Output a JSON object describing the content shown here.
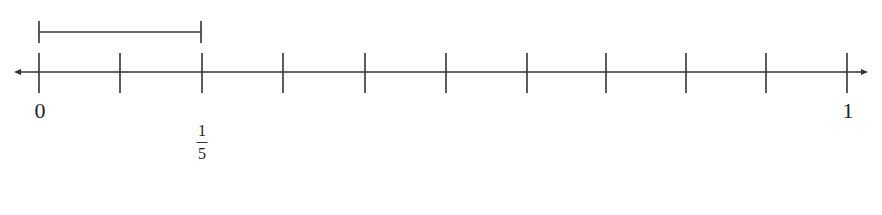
{
  "diagram": {
    "type": "number-line",
    "range": [
      0,
      1
    ],
    "intervals": 10,
    "tick_positions_px": [
      39,
      120,
      202,
      283,
      365,
      446,
      527,
      606,
      686,
      766,
      847
    ],
    "line_y": 72,
    "arrows": "both",
    "labels": {
      "zero": "0",
      "one": "1",
      "fifth_numerator": "1",
      "fifth_denominator": "5"
    },
    "bracket": {
      "from_px": 39,
      "to_px": 202,
      "y": 32,
      "represents": "1/5"
    },
    "color": "#333333"
  }
}
